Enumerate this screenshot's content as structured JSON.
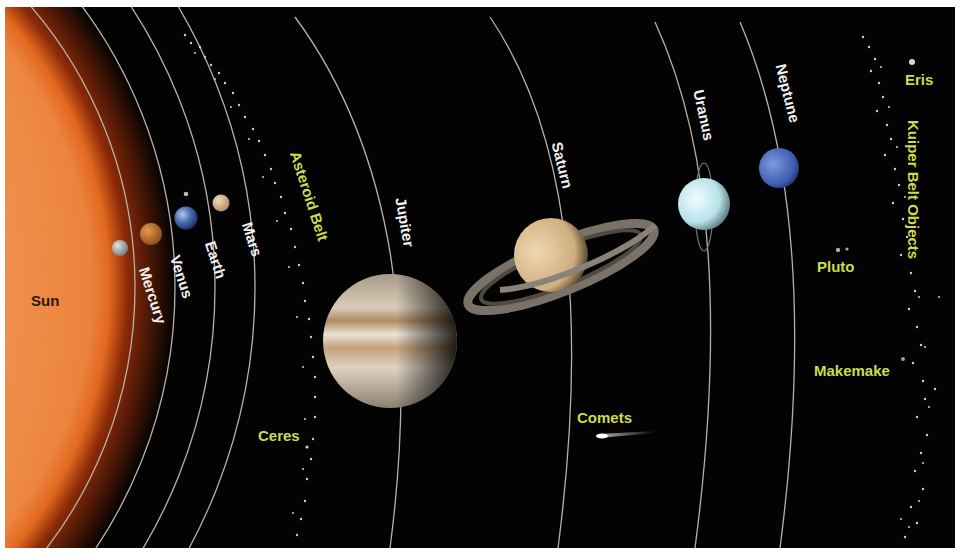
{
  "colors": {
    "background": "#030303",
    "planet_label": "#f2f2f2",
    "minor_body_label": "#cbdc4e",
    "orbit_line": "#b9b2a4",
    "sun": "#f08a3a"
  },
  "sun": {
    "label": "Sun"
  },
  "planets": [
    {
      "name": "Mercury",
      "label": "Mercury",
      "color": "#a9a9a9"
    },
    {
      "name": "Venus",
      "label": "Venus",
      "color": "#c0702a"
    },
    {
      "name": "Earth",
      "label": "Earth",
      "color": "#4a6fb3"
    },
    {
      "name": "Mars",
      "label": "Mars",
      "color": "#d9b38a"
    },
    {
      "name": "Jupiter",
      "label": "Jupiter",
      "color": "#cbb79a"
    },
    {
      "name": "Saturn",
      "label": "Saturn",
      "color": "#e2c99a"
    },
    {
      "name": "Uranus",
      "label": "Uranus",
      "color": "#c8ecf2"
    },
    {
      "name": "Neptune",
      "label": "Neptune",
      "color": "#4466b8"
    }
  ],
  "minor_bodies": [
    {
      "name": "Asteroid Belt",
      "label": "Asteroid Belt"
    },
    {
      "name": "Ceres",
      "label": "Ceres"
    },
    {
      "name": "Comets",
      "label": "Comets"
    },
    {
      "name": "Pluto",
      "label": "Pluto"
    },
    {
      "name": "Makemake",
      "label": "Makemake"
    },
    {
      "name": "Eris",
      "label": "Eris"
    },
    {
      "name": "Kuiper Belt Objects",
      "label": "Kuiper Belt Objects"
    }
  ]
}
